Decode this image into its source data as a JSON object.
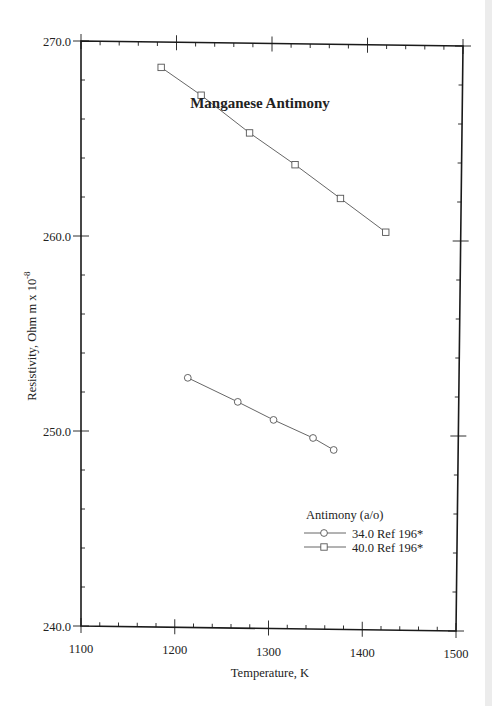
{
  "chart_data": {
    "type": "line",
    "title": "Manganese Antimony",
    "xlabel": "Temperature,  K",
    "ylabel": "Resistivity, Ohm m x 10",
    "ylabel_exponent": "-8",
    "xlim": [
      1100,
      1500
    ],
    "ylim": [
      240.0,
      270.0
    ],
    "x_ticks": [
      1100,
      1200,
      1300,
      1400,
      1500
    ],
    "x_tick_labels": [
      "1100",
      "1200",
      "1300",
      "1400",
      "1500"
    ],
    "x_minor_step": 20,
    "y_ticks": [
      240.0,
      250.0,
      260.0,
      270.0
    ],
    "y_tick_labels": [
      "240.0",
      "250.0",
      "260.0",
      "270.0"
    ],
    "y_minor_step": 2,
    "grid": false,
    "legend": {
      "title": "Antimony (a/o)",
      "position": "lower right",
      "entries": [
        "34.0 Ref 196*",
        "40.0 Ref 196*"
      ]
    },
    "series": [
      {
        "name": "34.0 Ref 196*",
        "marker": "circle",
        "x": [
          1213,
          1266,
          1304,
          1346,
          1368
        ],
        "y": [
          252.8,
          251.6,
          250.7,
          249.8,
          249.2
        ]
      },
      {
        "name": "40.0 Ref 196*",
        "marker": "square",
        "x": [
          1184,
          1226,
          1277,
          1325,
          1373,
          1421
        ],
        "y": [
          268.7,
          267.3,
          265.4,
          263.8,
          262.1,
          260.4
        ]
      }
    ]
  },
  "colors": {
    "axis": "#1a1a1a",
    "series_line": "#555555",
    "marker": "#555555",
    "background": "#ffffff"
  }
}
